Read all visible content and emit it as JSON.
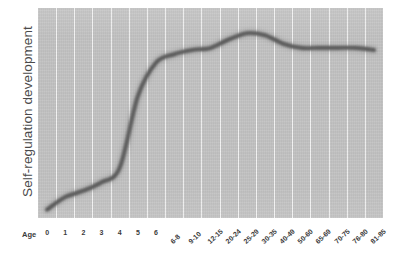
{
  "chart_data": {
    "type": "line",
    "title": "",
    "subtitle": "",
    "xlabel": "Age",
    "ylabel": "Self-regulation development",
    "grid": "vertical-only",
    "legend": "none",
    "axis_ticks_shown": false,
    "ylim": [
      0,
      100
    ],
    "categories": [
      "0",
      "1",
      "2",
      "3",
      "4",
      "5",
      "6",
      "6-8",
      "9-10",
      "12-15",
      "20-24",
      "25-29",
      "30-35",
      "40-49",
      "50-60",
      "65-69",
      "70-75",
      "76-80",
      "81-85"
    ],
    "series": [
      {
        "name": "Self-regulation development",
        "color": "#4f4f4f",
        "values": [
          4,
          10,
          13,
          17,
          24,
          58,
          74,
          78,
          80,
          81,
          85,
          88,
          87,
          83,
          81,
          81,
          81,
          81,
          80
        ]
      }
    ],
    "annotations": []
  },
  "axes": {
    "y": {
      "title": "Self-regulation development"
    },
    "x": {
      "title": "Age",
      "labels": [
        "0",
        "1",
        "2",
        "3",
        "4",
        "5",
        "6",
        "6-8",
        "9-10",
        "12-15",
        "20-24",
        "25-29",
        "30-35",
        "40-49",
        "50-60",
        "65-69",
        "70-75",
        "76-80",
        "81-85"
      ]
    }
  },
  "style": {
    "plot_background": "#c2c2c2",
    "gridline_color": "#ffffff",
    "curve_color": "#4f4f4f",
    "text_color": "#3b3b3b",
    "page_background": "#ffffff"
  }
}
